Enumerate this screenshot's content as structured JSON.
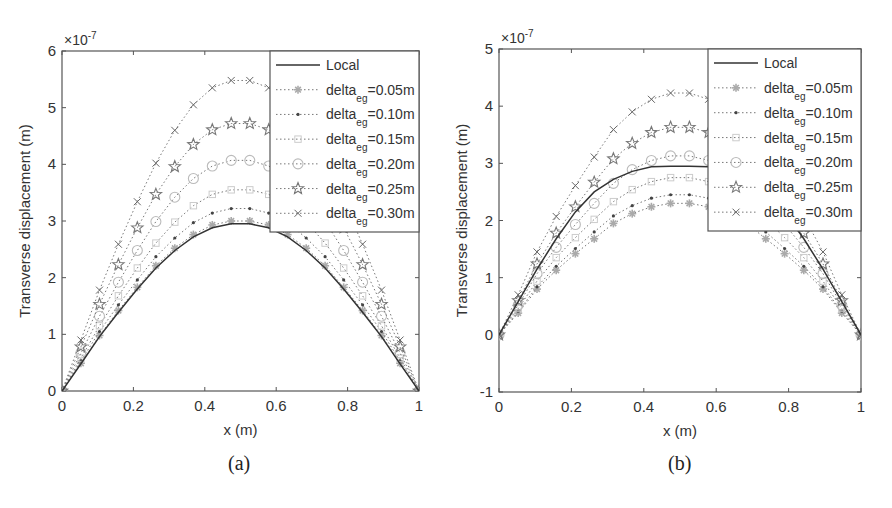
{
  "chart_data": [
    {
      "panel": "a",
      "caption": "(a)",
      "type": "line",
      "title": "",
      "xlabel": "x (m)",
      "ylabel": "Transverse displacement (m)",
      "y_exponent_label": "×10",
      "y_exponent": "-7",
      "xlim": [
        0,
        1
      ],
      "ylim": [
        0,
        6
      ],
      "xticks": [
        "0",
        "0.2",
        "0.4",
        "0.6",
        "0.8",
        "1"
      ],
      "yticks": [
        "0",
        "1",
        "2",
        "3",
        "4",
        "5",
        "6"
      ],
      "grid": false,
      "legend_position": "top-right (inside)",
      "x": [
        0,
        0.053,
        0.105,
        0.158,
        0.211,
        0.263,
        0.316,
        0.368,
        0.421,
        0.474,
        0.526,
        0.579,
        0.632,
        0.684,
        0.737,
        0.789,
        0.842,
        0.895,
        0.947,
        1
      ],
      "series": [
        {
          "name": "Local",
          "style": "solid",
          "marker": "none",
          "color": "#333333",
          "peak": 2.95,
          "values": [
            0,
            0.48,
            0.96,
            1.39,
            1.8,
            2.17,
            2.48,
            2.72,
            2.88,
            2.95,
            2.95,
            2.88,
            2.72,
            2.48,
            2.17,
            1.8,
            1.39,
            0.96,
            0.48,
            0
          ]
        },
        {
          "name": "delta_eg=0.05m",
          "label_main": "delta",
          "label_sub": "eg",
          "label_tail": "=0.05m",
          "style": "dotted",
          "marker": "asterisk",
          "color": "#aaaaaa",
          "peak": 3.0,
          "values": [
            0,
            0.49,
            0.98,
            1.42,
            1.83,
            2.21,
            2.52,
            2.76,
            2.93,
            3.0,
            3.0,
            2.93,
            2.76,
            2.52,
            2.21,
            1.83,
            1.42,
            0.98,
            0.49,
            0
          ]
        },
        {
          "name": "delta_eg=0.10m",
          "label_main": "delta",
          "label_sub": "eg",
          "label_tail": "=0.10m",
          "style": "dotted",
          "marker": "dot",
          "color": "#444444",
          "peak": 3.22,
          "values": [
            0,
            0.53,
            1.05,
            1.52,
            1.96,
            2.37,
            2.7,
            2.97,
            3.14,
            3.22,
            3.22,
            3.14,
            2.97,
            2.7,
            2.37,
            1.96,
            1.52,
            1.05,
            0.53,
            0
          ]
        },
        {
          "name": "delta_eg=0.15m",
          "label_main": "delta",
          "label_sub": "eg",
          "label_tail": "=0.15m",
          "style": "dotted",
          "marker": "square",
          "color": "#cccccc",
          "peak": 3.55,
          "values": [
            0,
            0.58,
            1.15,
            1.68,
            2.17,
            2.61,
            2.98,
            3.27,
            3.47,
            3.55,
            3.55,
            3.47,
            3.27,
            2.98,
            2.61,
            2.17,
            1.68,
            1.15,
            0.58,
            0
          ]
        },
        {
          "name": "delta_eg=0.20m",
          "label_main": "delta",
          "label_sub": "eg",
          "label_tail": "=0.20m",
          "style": "dotted",
          "marker": "circle",
          "color": "#bbbbbb",
          "peak": 4.07,
          "values": [
            0,
            0.67,
            1.32,
            1.92,
            2.48,
            2.99,
            3.42,
            3.75,
            3.97,
            4.07,
            4.07,
            3.97,
            3.75,
            3.42,
            2.99,
            2.48,
            1.92,
            1.32,
            0.67,
            0
          ]
        },
        {
          "name": "delta_eg=0.25m",
          "label_main": "delta",
          "label_sub": "eg",
          "label_tail": "=0.25m",
          "style": "dotted",
          "marker": "pentagram",
          "color": "#777777",
          "peak": 4.72,
          "values": [
            0,
            0.78,
            1.53,
            2.23,
            2.88,
            3.47,
            3.96,
            4.35,
            4.61,
            4.72,
            4.72,
            4.61,
            4.35,
            3.96,
            3.47,
            2.88,
            2.23,
            1.53,
            0.78,
            0
          ]
        },
        {
          "name": "delta_eg=0.30m",
          "label_main": "delta",
          "label_sub": "eg",
          "label_tail": "=0.30m",
          "style": "dotted",
          "marker": "x",
          "color": "#666666",
          "peak": 5.48,
          "values": [
            0,
            0.9,
            1.78,
            2.59,
            3.34,
            4.02,
            4.6,
            5.05,
            5.35,
            5.48,
            5.48,
            5.35,
            5.05,
            4.6,
            4.02,
            3.34,
            2.59,
            1.78,
            0.9,
            0
          ]
        }
      ]
    },
    {
      "panel": "b",
      "caption": "(b)",
      "type": "line",
      "title": "",
      "xlabel": "x (m)",
      "ylabel": "Transverse displacement (m)",
      "y_exponent_label": "×10",
      "y_exponent": "-7",
      "xlim": [
        0,
        1
      ],
      "ylim": [
        -1,
        5
      ],
      "xticks": [
        "0",
        "0.2",
        "0.4",
        "0.6",
        "0.8",
        "1"
      ],
      "yticks": [
        "-1",
        "0",
        "1",
        "2",
        "3",
        "4",
        "5"
      ],
      "grid": false,
      "legend_position": "top-right (inside)",
      "x": [
        0,
        0.053,
        0.105,
        0.158,
        0.211,
        0.263,
        0.316,
        0.368,
        0.421,
        0.474,
        0.526,
        0.579,
        0.632,
        0.684,
        0.737,
        0.789,
        0.842,
        0.895,
        0.947,
        1
      ],
      "series": [
        {
          "name": "Local",
          "style": "solid",
          "marker": "none",
          "color": "#333333",
          "peak": 2.95,
          "values": [
            0,
            0.58,
            1.15,
            1.68,
            2.15,
            2.5,
            2.72,
            2.86,
            2.94,
            2.95,
            2.95,
            2.94,
            2.86,
            2.72,
            2.5,
            2.15,
            1.68,
            1.15,
            0.58,
            0
          ]
        },
        {
          "name": "delta_eg=0.05m",
          "label_main": "delta",
          "label_sub": "eg",
          "label_tail": "=0.05m",
          "style": "dotted",
          "marker": "asterisk",
          "color": "#aaaaaa",
          "peak": 2.3,
          "values": [
            0,
            0.38,
            0.8,
            1.13,
            1.42,
            1.68,
            1.95,
            2.12,
            2.24,
            2.3,
            2.3,
            2.24,
            2.12,
            1.95,
            1.68,
            1.42,
            1.13,
            0.8,
            0.38,
            0
          ]
        },
        {
          "name": "delta_eg=0.10m",
          "label_main": "delta",
          "label_sub": "eg",
          "label_tail": "=0.10m",
          "style": "dotted",
          "marker": "dot",
          "color": "#444444",
          "peak": 2.45,
          "values": [
            0,
            0.41,
            0.84,
            1.2,
            1.51,
            1.8,
            2.08,
            2.26,
            2.39,
            2.45,
            2.45,
            2.39,
            2.26,
            2.08,
            1.8,
            1.51,
            1.2,
            0.84,
            0.41,
            0
          ]
        },
        {
          "name": "delta_eg=0.15m",
          "label_main": "delta",
          "label_sub": "eg",
          "label_tail": "=0.15m",
          "style": "dotted",
          "marker": "square",
          "color": "#cccccc",
          "peak": 2.75,
          "values": [
            0,
            0.46,
            0.94,
            1.35,
            1.7,
            2.02,
            2.33,
            2.54,
            2.68,
            2.75,
            2.75,
            2.68,
            2.54,
            2.33,
            2.02,
            1.7,
            1.35,
            0.94,
            0.46,
            0
          ]
        },
        {
          "name": "delta_eg=0.20m",
          "label_main": "delta",
          "label_sub": "eg",
          "label_tail": "=0.20m",
          "style": "dotted",
          "marker": "circle",
          "color": "#bbbbbb",
          "peak": 3.13,
          "values": [
            0,
            0.52,
            1.07,
            1.53,
            1.93,
            2.3,
            2.65,
            2.89,
            3.05,
            3.13,
            3.13,
            3.05,
            2.89,
            2.65,
            2.3,
            1.93,
            1.53,
            1.07,
            0.52,
            0
          ]
        },
        {
          "name": "delta_eg=0.25m",
          "label_main": "delta",
          "label_sub": "eg",
          "label_tail": "=0.25m",
          "style": "dotted",
          "marker": "pentagram",
          "color": "#777777",
          "peak": 3.63,
          "values": [
            0,
            0.6,
            1.24,
            1.78,
            2.24,
            2.67,
            3.08,
            3.35,
            3.54,
            3.63,
            3.63,
            3.54,
            3.35,
            3.08,
            2.67,
            2.24,
            1.78,
            1.24,
            0.6,
            0
          ]
        },
        {
          "name": "delta_eg=0.30m",
          "label_main": "delta",
          "label_sub": "eg",
          "label_tail": "=0.30m",
          "style": "dotted",
          "marker": "x",
          "color": "#666666",
          "peak": 4.23,
          "values": [
            0,
            0.7,
            1.45,
            2.07,
            2.61,
            3.11,
            3.59,
            3.9,
            4.12,
            4.23,
            4.23,
            4.12,
            3.9,
            3.59,
            3.11,
            2.61,
            2.07,
            1.45,
            0.7,
            0
          ]
        }
      ]
    }
  ],
  "figure": {
    "panel_a": {
      "caption": "(a)",
      "xlabel": "x (m)",
      "ylabel": "Transverse displacement (m)",
      "exp_base": "×10",
      "exp_power": "-7",
      "legend_local": "Local"
    },
    "panel_b": {
      "caption": "(b)",
      "xlabel": "x (m)",
      "ylabel": "Transverse displacement (m)",
      "exp_base": "×10",
      "exp_power": "-7",
      "legend_local": "Local"
    }
  }
}
